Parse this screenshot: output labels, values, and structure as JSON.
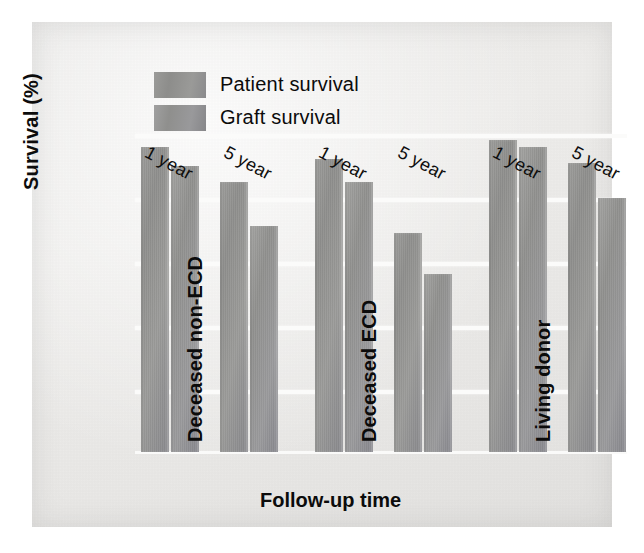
{
  "chart_data": {
    "type": "bar",
    "title": "",
    "xlabel": "Follow-up time",
    "ylabel": "Survival (%)",
    "ylim": [
      0,
      100
    ],
    "yticks": [
      0,
      20,
      40,
      60,
      80,
      100
    ],
    "grid": true,
    "legend_position": "top-left",
    "categories": [
      "1 year",
      "5 year",
      "1 year",
      "5 year",
      "1 year",
      "5 year"
    ],
    "groups": [
      {
        "name": "Deceased non-ECD",
        "categories": [
          "1 year",
          "5 year"
        ],
        "patient_survival": [
          96,
          85
        ],
        "graft_survival": [
          90,
          71
        ]
      },
      {
        "name": "Deceased ECD",
        "categories": [
          "1 year",
          "5 year"
        ],
        "patient_survival": [
          92,
          69
        ],
        "graft_survival": [
          85,
          56
        ]
      },
      {
        "name": "Living donor",
        "categories": [
          "1 year",
          "5 year"
        ],
        "patient_survival": [
          98,
          91
        ],
        "graft_survival": [
          96,
          80
        ]
      }
    ],
    "series": [
      {
        "name": "Patient survival",
        "color": "#91918f",
        "values": [
          96,
          85,
          92,
          69,
          98,
          91
        ]
      },
      {
        "name": "Graft survival",
        "color": "#94948f",
        "values": [
          90,
          71,
          85,
          56,
          96,
          80
        ]
      }
    ]
  },
  "legend": {
    "items": [
      {
        "label": "Patient survival",
        "key": "patient"
      },
      {
        "label": "Graft survival",
        "key": "graft"
      }
    ]
  },
  "axes": {
    "y_ticks": [
      "100",
      "80",
      "60",
      "40",
      "20",
      "0"
    ],
    "y_title": "Survival (%)",
    "x_title": "Follow-up time",
    "x_ticks": [
      "1 year",
      "5 year",
      "1 year",
      "5 year",
      "1 year",
      "5 year"
    ],
    "group_labels": [
      "Deceased non-ECD",
      "Deceased ECD",
      "Living donor"
    ]
  }
}
